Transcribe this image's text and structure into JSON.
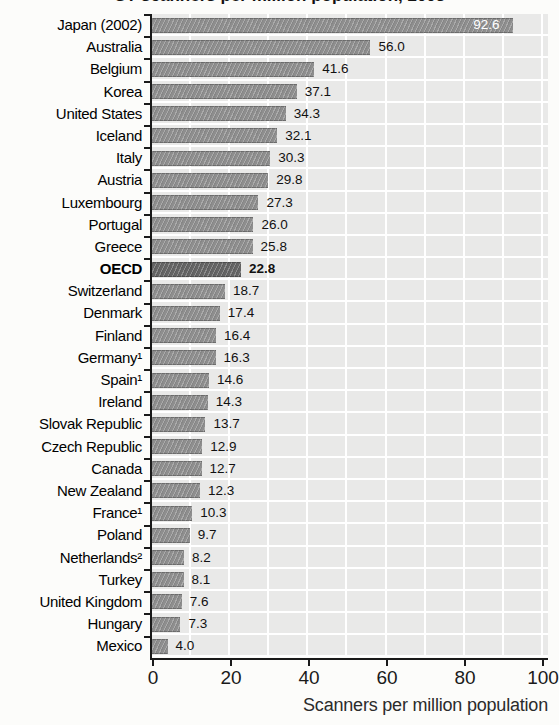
{
  "figure": {
    "cropped_title": "CT scanners per million population, 2003",
    "background": "#fcfcfa"
  },
  "chart_data": {
    "type": "bar",
    "orientation": "horizontal",
    "xlabel": "Scanners per million population",
    "xlim": [
      0,
      101
    ],
    "x_ticks": [
      0,
      20,
      40,
      60,
      80,
      100
    ],
    "grid": "white vertical gridlines every 10 units over light-gray row bands",
    "legend": "none",
    "categories": [
      "Japan (2002)",
      "Australia",
      "Belgium",
      "Korea",
      "United States",
      "Iceland",
      "Italy",
      "Austria",
      "Luxembourg",
      "Portugal",
      "Greece",
      "OECD",
      "Switzerland",
      "Denmark",
      "Finland",
      "Germany¹",
      "Spain¹",
      "Ireland",
      "Slovak Republic",
      "Czech Republic",
      "Canada",
      "New Zealand",
      "France¹",
      "Poland",
      "Netherlands²",
      "Turkey",
      "United Kingdom",
      "Hungary",
      "Mexico"
    ],
    "values": [
      "92.6",
      "56.0",
      "41.6",
      "37.1",
      "34.3",
      "32.1",
      "30.3",
      "29.8",
      "27.3",
      "26.0",
      "25.8",
      "22.8",
      "18.7",
      "17.4",
      "16.4",
      "16.3",
      "14.6",
      "14.3",
      "13.7",
      "12.9",
      "12.7",
      "12.3",
      "10.3",
      "9.7",
      "8.2",
      "8.1",
      "7.6",
      "7.3",
      "4.0"
    ],
    "emphasized_index": 11,
    "value_label_inside_bar_index": 0,
    "colors": {
      "bar": "#8e8e8e",
      "bar_emphasis": "#646464",
      "row_band": "#e9e9e8",
      "gridline": "#ffffff",
      "axis": "#1a1a1a",
      "value_text": "#111111",
      "value_text_inside": "#ffffff",
      "label_text": "#000000",
      "caption_text": "#2b2b2b"
    }
  }
}
